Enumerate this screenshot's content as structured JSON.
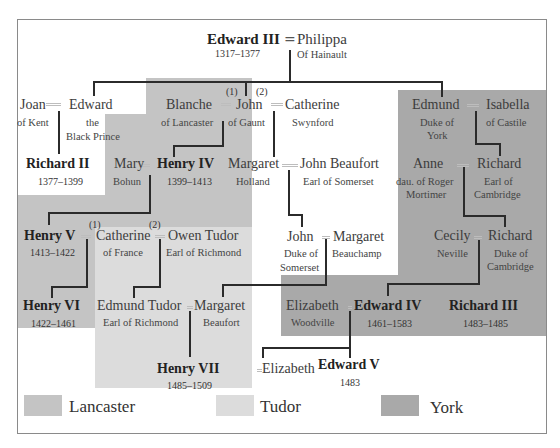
{
  "diagram": {
    "colors": {
      "lancaster": "#c4c4c4",
      "tudor": "#dcdcdc",
      "york": "#a9a9a9",
      "line": "#2b2b2b"
    },
    "people": {
      "edward3": {
        "name": "Edward III",
        "sub": "1317–1377"
      },
      "philippa": {
        "name": "Philippa",
        "sub": "Of Hainault"
      },
      "joan": {
        "name": "Joan",
        "sub": "of Kent"
      },
      "edward_bp": {
        "name": "Edward",
        "sub1": "the",
        "sub2": "Black Prince"
      },
      "blanche": {
        "name": "Blanche",
        "sub": "of Lancaster"
      },
      "john_gaunt": {
        "name": "John",
        "sub": "of Gaunt"
      },
      "catherine_s": {
        "name": "Catherine",
        "sub": "Swynford"
      },
      "edmund": {
        "name": "Edmund",
        "sub1": "Duke of",
        "sub2": "York"
      },
      "isabella": {
        "name": "Isabella",
        "sub": "of Castile"
      },
      "richard2": {
        "name": "Richard II",
        "sub": "1377–1399"
      },
      "mary": {
        "name": "Mary",
        "sub": "Bohun"
      },
      "henry4": {
        "name": "Henry IV",
        "sub": "1399–1413"
      },
      "margaret_h": {
        "name": "Margaret",
        "sub": "Holland"
      },
      "john_beaufort": {
        "name": "John Beaufort",
        "sub": "Earl of Somerset"
      },
      "anne": {
        "name": "Anne",
        "sub1": "dau. of Roger",
        "sub2": "Mortimer"
      },
      "richard_c": {
        "name": "Richard",
        "sub1": "Earl of",
        "sub2": "Cambridge"
      },
      "henry5": {
        "name": "Henry V",
        "sub": "1413–1422"
      },
      "catherine_f": {
        "name": "Catherine",
        "sub": "of France"
      },
      "owen": {
        "name": "Owen Tudor",
        "sub": "Earl of Richmond"
      },
      "john_som": {
        "name": "John",
        "sub1": "Duke of",
        "sub2": "Somerset"
      },
      "margaret_b": {
        "name": "Margaret",
        "sub": "Beauchamp"
      },
      "cecily": {
        "name": "Cecily",
        "sub": "Neville"
      },
      "richard_y": {
        "name": "Richard",
        "sub1": "Duke of",
        "sub2": "Cambridge"
      },
      "henry6": {
        "name": "Henry VI",
        "sub": "1422–1461"
      },
      "edmund_t": {
        "name": "Edmund Tudor",
        "sub": "Earl of Richmond"
      },
      "margaret_bf": {
        "name": "Margaret",
        "sub": "Beaufort"
      },
      "elizabeth_w": {
        "name": "Elizabeth",
        "sub": "Woodville"
      },
      "edward4": {
        "name": "Edward IV",
        "sub": "1461–1583"
      },
      "richard3": {
        "name": "Richard III",
        "sub": "1483–1485"
      },
      "henry7": {
        "name": "Henry VII",
        "sub": "1485–1509"
      },
      "elizabeth_y": {
        "name": "Elizabeth"
      },
      "edward5": {
        "name": "Edward V",
        "sub": "1483"
      }
    },
    "marriage_marks": {
      "first": "(1)",
      "second": "(2)"
    },
    "legend": [
      {
        "label": "Lancaster",
        "color": "#c4c4c4"
      },
      {
        "label": "Tudor",
        "color": "#dcdcdc"
      },
      {
        "label": "York",
        "color": "#a9a9a9"
      }
    ]
  }
}
